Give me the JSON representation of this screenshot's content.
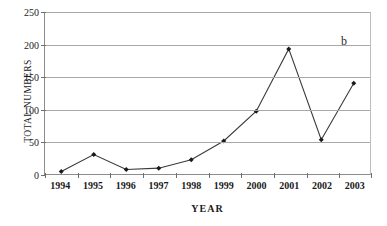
{
  "chart_data": {
    "type": "line",
    "title": "",
    "xlabel": "YEAR",
    "ylabel": "TOTAL NUMBERS",
    "categories": [
      "1994",
      "1995",
      "1996",
      "1997",
      "1998",
      "1999",
      "2000",
      "2001",
      "2002",
      "2003"
    ],
    "values": [
      4,
      30,
      7,
      9,
      22,
      51,
      97,
      193,
      53,
      140
    ],
    "ylim": [
      0,
      250
    ],
    "ytick_values": [
      0,
      50,
      100,
      150,
      200,
      250
    ],
    "ytick_labels": [
      "0",
      "50",
      "100",
      "150",
      "200",
      "250"
    ],
    "grid": "horizontal",
    "legend": "none",
    "annotations": [
      {
        "text": "b",
        "position": "top-right"
      }
    ],
    "series": [
      {
        "name": "total numbers",
        "values": [
          4,
          30,
          7,
          9,
          22,
          51,
          97,
          193,
          53,
          140
        ],
        "marker": "diamond",
        "line_color": "#3a3a3a",
        "marker_color": "#1a1a1a"
      }
    ],
    "colors": {
      "line": "#3a3a3a",
      "marker": "#1a1a1a",
      "grid": "#a8a8a8",
      "axis": "#8c8c8c",
      "background": "#ffffff",
      "text": "#1a1a1a"
    }
  },
  "panel": {
    "label": "b"
  },
  "axes": {
    "y_title": "TOTAL NUMBERS",
    "x_title": "YEAR"
  }
}
